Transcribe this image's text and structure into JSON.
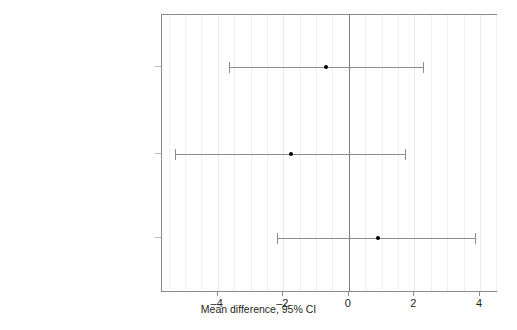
{
  "chart_data": {
    "type": "scatter",
    "subtype": "forest-plot-confidence-intervals",
    "title": "",
    "xlabel": "Mean difference, 95% CI",
    "ylabel": "",
    "xlim": [
      -5.7,
      4.55
    ],
    "xticks": [
      -4,
      -2,
      0,
      2,
      4
    ],
    "xtick_labels": [
      "–4",
      "–2",
      "0",
      "2",
      "4"
    ],
    "grid": true,
    "grid_axis": "x",
    "grid_step": 0.5,
    "reference_line": 0,
    "legend": "none",
    "categories": [
      "omni vs avg of diets",
      "omni vs avg of carni and insecti",
      "carni vs herbi"
    ],
    "points": [
      {
        "category": "omni vs avg of diets",
        "estimate": -0.7,
        "ci_low": -3.65,
        "ci_high": 2.25
      },
      {
        "category": "omni vs avg of carni and insecti",
        "estimate": -1.75,
        "ci_low": -5.3,
        "ci_high": 1.7
      },
      {
        "category": "carni vs herbi",
        "estimate": 0.9,
        "ci_low": -2.2,
        "ci_high": 3.85
      }
    ],
    "colors": {
      "point": "#000000",
      "interval": "#8c8c8c",
      "reference_line": "#7d7d7d",
      "frame": "#8a8a8a",
      "grid": "#f0f0f0",
      "text": "#231f20",
      "background": "#ffffff"
    }
  }
}
